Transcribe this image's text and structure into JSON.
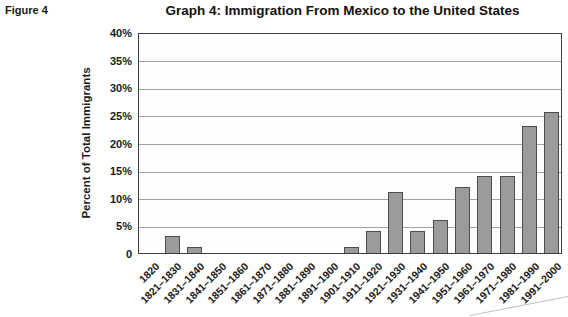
{
  "figure_label": "Figure 4",
  "chart_data": {
    "type": "bar",
    "title": "Graph 4: Immigration From Mexico to the United States",
    "ylabel": "Percent of Total Immigrants",
    "xlabel": "",
    "ylim": [
      0,
      40
    ],
    "ytick_step": 5,
    "ytick_labels": [
      "40%",
      "35%",
      "30%",
      "25%",
      "20%",
      "15%",
      "10%",
      "5%",
      "0"
    ],
    "grid": true,
    "legend": "none",
    "categories": [
      "1820",
      "1821–1830",
      "1831–1840",
      "1841–1850",
      "1851–1860",
      "1861–1870",
      "1871–1880",
      "1881–1890",
      "1891–1900",
      "1901–1910",
      "1911–1920",
      "1921–1930",
      "1931–1940",
      "1941–1950",
      "1951–1960",
      "1961–1970",
      "1971–1980",
      "1981–1990",
      "1991–2000"
    ],
    "values": [
      0,
      3,
      1,
      0,
      0,
      0,
      0,
      0,
      0,
      1,
      4,
      11,
      4,
      6,
      12,
      14,
      14,
      23,
      25.5
    ],
    "bar_color": "#9b9b9b",
    "bar_border_color": "#4d4d4d",
    "gridline_color": "#a2a2a2"
  }
}
